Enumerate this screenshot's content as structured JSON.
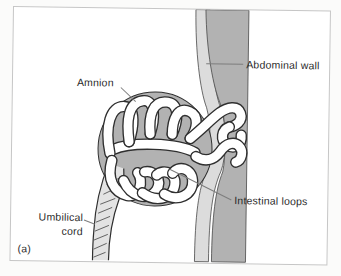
{
  "figure": {
    "panel_label": "(a)",
    "labels": {
      "amnion": "Amnion",
      "abdominal_wall": "Abdominal wall",
      "intestinal_loops": "Intestinal loops",
      "umbilical_cord": "Umbilical cord"
    },
    "colors": {
      "background": "#fbfbfa",
      "frame_border": "#c6c6c6",
      "panel_background": "#ffffff",
      "abdominal_wall_dark": "#b2b2b2",
      "abdominal_wall_light": "#dcdcdc",
      "amnion_sac": "#b2b2b2",
      "umbilical_cord_fill": "#e3e3e3",
      "intestine_fill": "#ffffff",
      "outline": "#2f2f2f",
      "leader_line": "#7d7d7d",
      "text": "#2b2b2b"
    }
  }
}
